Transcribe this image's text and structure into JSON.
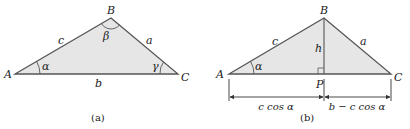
{
  "colors": {
    "fill": "#e6e6e6",
    "stroke": "#555555",
    "text": "#222222"
  },
  "figure_a": {
    "caption": "(a)",
    "vertices": {
      "A": "A",
      "B": "B",
      "C": "C"
    },
    "sides": {
      "a": "a",
      "b": "b",
      "c": "c"
    },
    "angles": {
      "alpha": "α",
      "beta": "β",
      "gamma": "γ"
    }
  },
  "figure_b": {
    "caption": "(b)",
    "vertices": {
      "A": "A",
      "B": "B",
      "C": "C",
      "P": "P"
    },
    "sides": {
      "a": "a",
      "c": "c",
      "h": "h"
    },
    "angles": {
      "alpha": "α"
    },
    "dimensions": {
      "left": "c cos α",
      "right": "b − c cos α"
    }
  }
}
